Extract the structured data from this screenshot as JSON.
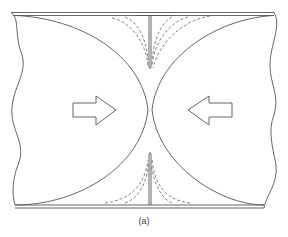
{
  "figure": {
    "caption": "(a)",
    "colors": {
      "line": "#555555",
      "dashed": "#666666",
      "background": "#ffffff"
    }
  },
  "arrows": [
    {
      "name": "left-arrow",
      "direction": "right"
    },
    {
      "name": "right-arrow",
      "direction": "left"
    }
  ]
}
